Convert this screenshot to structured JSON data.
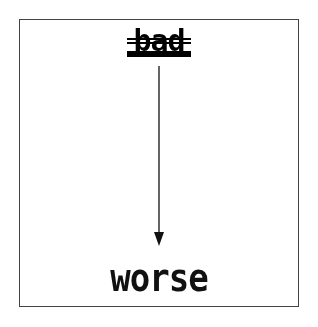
{
  "diagram": {
    "source_word": "bad",
    "target_word": "worse",
    "arrow_direction": "down",
    "colors": {
      "ink": "#111111",
      "frame": "#444444",
      "background": "#ffffff"
    }
  }
}
